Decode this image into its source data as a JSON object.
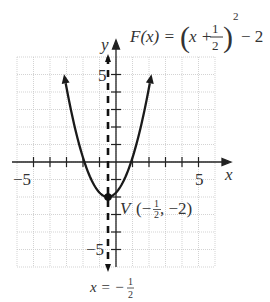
{
  "chart_data": {
    "type": "line",
    "function": "F(x) = (x + 1/2)^2 - 2",
    "xlabel": "x",
    "ylabel": "y",
    "xlim": [
      -6,
      6
    ],
    "ylim": [
      -6,
      6
    ],
    "grid": true,
    "x_tick_labels": [
      "-5",
      "5"
    ],
    "y_tick_labels": [
      "5",
      "-5"
    ],
    "series": [
      {
        "name": "F(x)",
        "x": [
          -3.3,
          -3,
          -2.5,
          -2,
          -1.5,
          -1,
          -0.5,
          0,
          0.5,
          1,
          1.5,
          2,
          2.3
        ],
        "y": [
          5.84,
          4.25,
          2,
          0.25,
          -1,
          -1.75,
          -2,
          -1.75,
          -1,
          0.25,
          2,
          4.25,
          5.84
        ]
      }
    ],
    "vertex": {
      "x": -0.5,
      "y": -2
    },
    "axis_of_symmetry": -0.5,
    "annotations": [
      {
        "text": "V(-1/2, -2)",
        "at": [
          -0.5,
          -2
        ]
      },
      {
        "text": "x = -1/2",
        "at": [
          -0.5,
          -6
        ]
      }
    ]
  },
  "labels": {
    "y_axis": "y",
    "x_axis": "x",
    "tick_pos5_x": "5",
    "tick_neg5_x": "−5",
    "tick_pos5_y": "5",
    "tick_neg5_y": "−5",
    "func_lhs": "F(x) =",
    "func_x_plus": "x +",
    "func_frac_num": "1",
    "func_frac_den": "2",
    "func_exp": "2",
    "func_tail": "− 2",
    "vertex_V": "V",
    "vertex_open": "(−",
    "vertex_num": "1",
    "vertex_den": "2",
    "vertex_close": ", −2)",
    "axis_eq_lhs": "x = −",
    "axis_eq_num": "1",
    "axis_eq_den": "2"
  }
}
